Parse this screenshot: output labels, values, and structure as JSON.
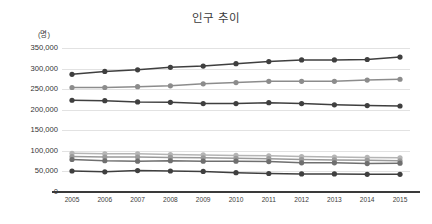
{
  "chart_data": {
    "type": "line",
    "title": "인구 추이",
    "xlabel": "",
    "ylabel": "(명)",
    "y_unit_label": "(명)",
    "categories": [
      "2005",
      "2006",
      "2007",
      "2008",
      "2009",
      "2010",
      "2011",
      "2012",
      "2013",
      "2014",
      "2015"
    ],
    "x": [
      2005,
      2006,
      2007,
      2008,
      2009,
      2010,
      2011,
      2012,
      2013,
      2014,
      2015
    ],
    "ylim": [
      0,
      350000
    ],
    "ytick_values": [
      0,
      50000,
      100000,
      150000,
      200000,
      250000,
      300000,
      350000
    ],
    "ytick_labels": [
      "0",
      "50,000",
      "100,000",
      "150,000",
      "200,000",
      "250,000",
      "300,000",
      "350,000"
    ],
    "grid": true,
    "legend": "none",
    "marker": "circle",
    "series": [
      {
        "name": "series-1",
        "color": "#3f3f3f",
        "values": [
          286000,
          293000,
          297000,
          303000,
          306000,
          312000,
          317000,
          321000,
          321000,
          322000,
          328000
        ]
      },
      {
        "name": "series-2",
        "color": "#8c8c8c",
        "values": [
          254000,
          254000,
          256000,
          258000,
          263000,
          266000,
          269000,
          269000,
          269000,
          272000,
          274000
        ]
      },
      {
        "name": "series-3",
        "color": "#3f3f3f",
        "values": [
          223000,
          222000,
          219000,
          218000,
          215000,
          215000,
          217000,
          215000,
          212000,
          210000,
          209000
        ]
      },
      {
        "name": "series-4",
        "color": "#b5b5b5",
        "values": [
          94000,
          93000,
          93000,
          91000,
          90000,
          89000,
          88000,
          86000,
          85000,
          84000,
          83000
        ]
      },
      {
        "name": "series-5",
        "color": "#9a9a9a",
        "values": [
          86000,
          85000,
          85000,
          84000,
          83000,
          82000,
          81000,
          79000,
          78000,
          77000,
          76000
        ]
      },
      {
        "name": "series-6",
        "color": "#6f6f6f",
        "values": [
          79000,
          76000,
          75000,
          76000,
          75000,
          75000,
          74000,
          71000,
          71000,
          69000,
          70000
        ]
      },
      {
        "name": "series-7",
        "color": "#3f3f3f",
        "values": [
          51000,
          49000,
          52000,
          51000,
          50000,
          47000,
          45000,
          44000,
          44000,
          43000,
          43000
        ]
      }
    ]
  }
}
